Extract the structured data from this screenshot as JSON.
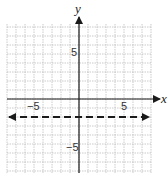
{
  "chart_data": {
    "type": "line",
    "title": "",
    "xlabel": "x",
    "ylabel": "y",
    "xlim": [
      -8,
      8
    ],
    "ylim": [
      -8,
      8
    ],
    "grid": true,
    "ticks_labeled": {
      "x": [
        -5,
        5
      ],
      "y": [
        5,
        -5
      ]
    },
    "tick_labels": {
      "x_neg": "−5",
      "x_pos": "5",
      "y_pos": "5",
      "y_neg": "−5"
    },
    "series": [
      {
        "name": "y = -2",
        "style": "dashed",
        "arrows": "both",
        "color": "#1a1a1a",
        "x": [
          -7.7,
          7.7
        ],
        "y": [
          -2,
          -2
        ]
      }
    ]
  },
  "labels": {
    "x_axis": "x",
    "y_axis": "y",
    "x_neg": "−5",
    "x_pos": "5",
    "y_pos": "5",
    "y_neg": "−5"
  }
}
